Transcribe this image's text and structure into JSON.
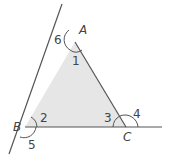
{
  "diagram": {
    "colors": {
      "fill": "#e6e6e6",
      "stroke": "#555555",
      "text": "#444444"
    },
    "vertices": {
      "A": "A",
      "B": "B",
      "C": "C"
    },
    "angles": {
      "interior_A": "1",
      "interior_B": "2",
      "interior_C": "3",
      "exterior_C": "4",
      "exterior_B": "5",
      "exterior_A": "6"
    }
  }
}
